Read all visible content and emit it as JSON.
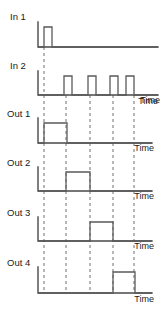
{
  "diagram": {
    "axis_label": "Time",
    "colors": {
      "background": "#ffffff",
      "axis": "#4a4a4a",
      "trace": "#5a5a5a",
      "guide": "#6e6e6e",
      "text": "#1a1a1a"
    },
    "rows": [
      {
        "label": "In 1",
        "name": "in-1",
        "time_label": "",
        "pulses": [
          {
            "start": 44,
            "end": 52
          }
        ]
      },
      {
        "label": "In 2",
        "name": "in-2",
        "time_label": "Time",
        "pulses": [
          {
            "start": 64,
            "end": 72
          },
          {
            "start": 88,
            "end": 96
          },
          {
            "start": 110,
            "end": 118
          },
          {
            "start": 126,
            "end": 134
          }
        ]
      },
      {
        "label": "Out 1",
        "name": "out-1",
        "time_label": "Time",
        "pulses": [
          {
            "start": 44,
            "end": 67
          }
        ]
      },
      {
        "label": "Out 2",
        "name": "out-2",
        "time_label": "Time",
        "pulses": [
          {
            "start": 66,
            "end": 90
          }
        ]
      },
      {
        "label": "Out 3",
        "name": "out-3",
        "time_label": "Time",
        "pulses": [
          {
            "start": 90,
            "end": 113
          }
        ]
      },
      {
        "label": "Out 4",
        "name": "out-4",
        "time_label": "Time",
        "pulses": [
          {
            "start": 113,
            "end": 135
          }
        ]
      }
    ],
    "guides": [
      {
        "x": 44,
        "name": "guide-edge-1"
      },
      {
        "x": 66,
        "name": "guide-edge-2"
      },
      {
        "x": 90,
        "name": "guide-edge-3"
      },
      {
        "x": 113,
        "name": "guide-edge-4"
      },
      {
        "x": 134,
        "name": "guide-edge-5"
      }
    ]
  }
}
